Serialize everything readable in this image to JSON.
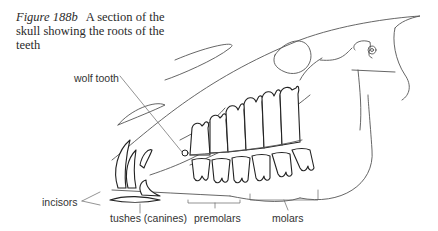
{
  "figure": {
    "number": "Figure 188b",
    "caption": "A section of the skull showing the roots of the teeth"
  },
  "labels": {
    "wolf_tooth": "wolf tooth",
    "incisors": "incisors",
    "tushes": "tushes (canines)",
    "premolars": "premolars",
    "molars": "molars"
  }
}
